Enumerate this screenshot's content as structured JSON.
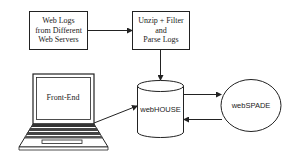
{
  "diagram": {
    "nodes": {
      "web_logs": {
        "lines": [
          "Web Logs",
          "from Different",
          "Web Servers"
        ]
      },
      "unzip": {
        "lines": [
          "Unzip + Filter",
          "and",
          "Parse Logs"
        ]
      },
      "front_end": {
        "label": "Front-End"
      },
      "webhouse": {
        "label": "webHOUSE"
      },
      "webspade": {
        "label": "webSPADE"
      }
    },
    "edges": [
      {
        "from": "web_logs",
        "to": "unzip"
      },
      {
        "from": "unzip",
        "to": "webhouse"
      },
      {
        "from": "front_end",
        "to": "webhouse"
      },
      {
        "from": "webhouse",
        "to": "webspade"
      },
      {
        "from": "webspade",
        "to": "webhouse"
      }
    ],
    "colors": {
      "stroke": "#222222",
      "background": "#ffffff"
    }
  }
}
